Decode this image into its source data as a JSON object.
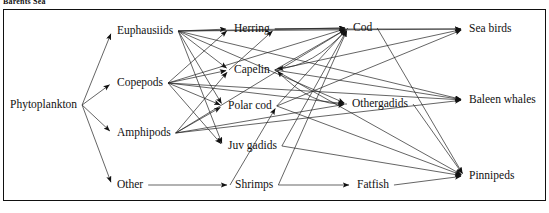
{
  "caption": {
    "top_text": "Barents Sea"
  },
  "diagram": {
    "type": "directed-food-web",
    "line_color": "#222222",
    "text_color": "#111111",
    "background": "#ffffff",
    "border_color": "#111111",
    "nodes": [
      {
        "id": "phytoplankton",
        "label": "Phytoplankton",
        "x": 10,
        "y": 105,
        "anchor": "start",
        "port_x": 83,
        "port_y": 105
      },
      {
        "id": "euphausiids",
        "label": "Euphausiids",
        "x": 117,
        "y": 31,
        "anchor": "start",
        "port_x": 112,
        "port_y": 31,
        "port_right_x": 178
      },
      {
        "id": "copepods",
        "label": "Copepods",
        "x": 117,
        "y": 83,
        "anchor": "start",
        "port_x": 112,
        "port_y": 83,
        "port_right_x": 170
      },
      {
        "id": "amphipods",
        "label": "Amphipods",
        "x": 117,
        "y": 133,
        "anchor": "start",
        "port_x": 112,
        "port_y": 133,
        "port_right_x": 176
      },
      {
        "id": "other",
        "label": "Other",
        "x": 117,
        "y": 185,
        "anchor": "start",
        "port_x": 112,
        "port_y": 185,
        "port_right_x": 152
      },
      {
        "id": "herring",
        "label": "Herring",
        "x": 234,
        "y": 29,
        "anchor": "start",
        "port_x": 229,
        "port_y": 29,
        "port_right_x": 277
      },
      {
        "id": "capelin",
        "label": "Capelin",
        "x": 234,
        "y": 70,
        "anchor": "start",
        "port_x": 229,
        "port_y": 70,
        "port_right_x": 275
      },
      {
        "id": "polar_cod",
        "label": "Polar cod",
        "x": 228,
        "y": 106,
        "anchor": "start",
        "port_x": 223,
        "port_y": 106,
        "port_right_x": 283
      },
      {
        "id": "juv_gadids",
        "label": "Juv gadids",
        "x": 228,
        "y": 146,
        "anchor": "start",
        "port_x": 223,
        "port_y": 146,
        "port_right_x": 285
      },
      {
        "id": "shrimps",
        "label": "Shrimps",
        "x": 235,
        "y": 185,
        "anchor": "start",
        "port_x": 230,
        "port_y": 185,
        "port_right_x": 281
      },
      {
        "id": "cod",
        "label": "Cod",
        "x": 353,
        "y": 28,
        "anchor": "start",
        "port_x": 348,
        "port_y": 28,
        "port_right_x": 374
      },
      {
        "id": "othergadids",
        "label": "Othergadids",
        "x": 352,
        "y": 104,
        "anchor": "start",
        "port_x": 347,
        "port_y": 104,
        "port_right_x": 417
      },
      {
        "id": "fatfish",
        "label": "Fatfish",
        "x": 357,
        "y": 185,
        "anchor": "start",
        "port_x": 352,
        "port_y": 185,
        "port_right_x": 398
      },
      {
        "id": "sea_birds",
        "label": "Sea birds",
        "x": 469,
        "y": 29,
        "anchor": "start",
        "port_x": 464,
        "port_y": 29
      },
      {
        "id": "baleen_whales",
        "label": "Baleen whales",
        "x": 469,
        "y": 100,
        "anchor": "start",
        "port_x": 464,
        "port_y": 100
      },
      {
        "id": "pinnipeds",
        "label": "Pinnipeds",
        "x": 469,
        "y": 176,
        "anchor": "start",
        "port_x": 464,
        "port_y": 176
      }
    ],
    "edges": [
      {
        "from": "phytoplankton",
        "to": "euphausiids"
      },
      {
        "from": "phytoplankton",
        "to": "copepods"
      },
      {
        "from": "phytoplankton",
        "to": "amphipods"
      },
      {
        "from": "phytoplankton",
        "to": "other"
      },
      {
        "from": "euphausiids",
        "to": "herring"
      },
      {
        "from": "euphausiids",
        "to": "capelin"
      },
      {
        "from": "euphausiids",
        "to": "polar_cod"
      },
      {
        "from": "euphausiids",
        "to": "juv_gadids"
      },
      {
        "from": "euphausiids",
        "to": "cod"
      },
      {
        "from": "euphausiids",
        "to": "othergadids"
      },
      {
        "from": "euphausiids",
        "to": "sea_birds"
      },
      {
        "from": "euphausiids",
        "to": "baleen_whales"
      },
      {
        "from": "copepods",
        "to": "herring"
      },
      {
        "from": "copepods",
        "to": "capelin"
      },
      {
        "from": "copepods",
        "to": "polar_cod"
      },
      {
        "from": "copepods",
        "to": "juv_gadids"
      },
      {
        "from": "copepods",
        "to": "cod"
      },
      {
        "from": "copepods",
        "to": "othergadids"
      },
      {
        "from": "copepods",
        "to": "baleen_whales"
      },
      {
        "from": "amphipods",
        "to": "capelin"
      },
      {
        "from": "amphipods",
        "to": "polar_cod"
      },
      {
        "from": "amphipods",
        "to": "cod"
      },
      {
        "from": "amphipods",
        "to": "othergadids"
      },
      {
        "from": "amphipods",
        "to": "baleen_whales"
      },
      {
        "from": "herring",
        "to": "cod"
      },
      {
        "from": "herring",
        "to": "sea_birds"
      },
      {
        "from": "capelin",
        "to": "herring"
      },
      {
        "from": "capelin",
        "to": "cod"
      },
      {
        "from": "capelin",
        "to": "sea_birds"
      },
      {
        "from": "capelin",
        "to": "baleen_whales"
      },
      {
        "from": "capelin",
        "to": "pinnipeds"
      },
      {
        "from": "polar_cod",
        "to": "cod"
      },
      {
        "from": "polar_cod",
        "to": "sea_birds"
      },
      {
        "from": "polar_cod",
        "to": "pinnipeds"
      },
      {
        "from": "juv_gadids",
        "to": "cod"
      },
      {
        "from": "juv_gadids",
        "to": "pinnipeds"
      },
      {
        "from": "shrimps",
        "to": "fatfish"
      },
      {
        "from": "shrimps",
        "to": "cod"
      },
      {
        "from": "shrimps",
        "to": "polar_cod"
      },
      {
        "from": "other",
        "to": "shrimps"
      },
      {
        "from": "cod",
        "to": "capelin"
      },
      {
        "from": "cod",
        "to": "pinnipeds"
      },
      {
        "from": "othergadids",
        "to": "capelin"
      },
      {
        "from": "othergadids",
        "to": "pinnipeds"
      },
      {
        "from": "fatfish",
        "to": "pinnipeds"
      }
    ]
  }
}
